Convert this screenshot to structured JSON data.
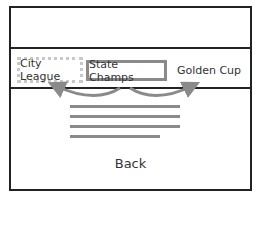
{
  "tabs": [
    {
      "label": "City League",
      "state": "previous-dotted"
    },
    {
      "label": "State Champs",
      "state": "selected"
    },
    {
      "label": "Golden Cup",
      "state": "next"
    }
  ],
  "content_lines": 4,
  "back_label": "Back",
  "colors": {
    "frame": "#222222",
    "selected_border": "#8a8a8a",
    "dotted_border": "#c8c8c8",
    "arrow": "#8a8a8a",
    "content_line": "#8a8a8a"
  }
}
